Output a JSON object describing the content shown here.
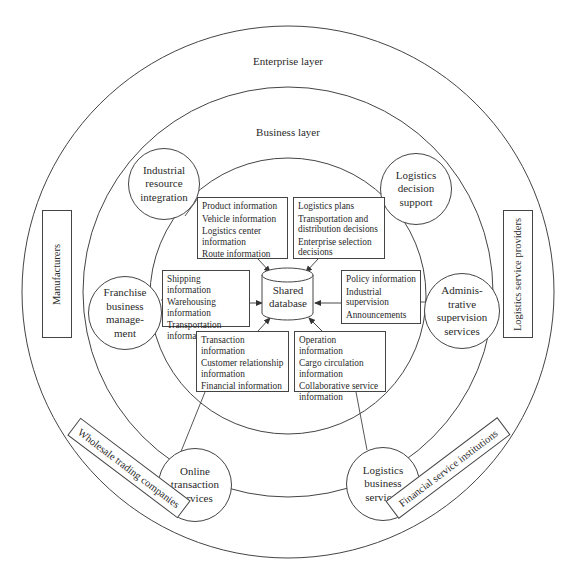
{
  "layers": {
    "enterprise": "Enterprise layer",
    "business": "Business layer"
  },
  "core": {
    "database_line1": "Shared",
    "database_line2": "database"
  },
  "service_nodes": [
    {
      "id": "industrial",
      "lines": [
        "Industrial",
        "resource",
        "integration"
      ]
    },
    {
      "id": "decision",
      "lines": [
        "Logistics",
        "decision",
        "support"
      ]
    },
    {
      "id": "franchise",
      "lines": [
        "Franchise",
        "business",
        "manage-",
        "ment"
      ]
    },
    {
      "id": "administrative",
      "lines": [
        "Adminis-",
        "trative",
        "supervision",
        "services"
      ]
    },
    {
      "id": "online",
      "lines": [
        "Online",
        "transaction",
        "services"
      ]
    },
    {
      "id": "logistics_business",
      "lines": [
        "Logistics",
        "business",
        "services"
      ]
    }
  ],
  "info_boxes": {
    "top_left": [
      "Product information",
      "Vehicle information",
      "Logistics center information",
      "Route information"
    ],
    "top_right": [
      "Logistics plans",
      "Transportation and distribution decisions",
      "Enterprise selection decisions"
    ],
    "left": [
      "Shipping information",
      "Warehousing information",
      "Transportation information"
    ],
    "right": [
      "Policy information",
      "Industrial supervision",
      "Announcements"
    ],
    "bottom_left": [
      "Transaction information",
      "Customer relationship information",
      "Financial information"
    ],
    "bottom_right": [
      "Operation information",
      "Cargo circulation information",
      "Collaborative service information"
    ]
  },
  "enterprises": {
    "left": "Manufacturers",
    "right": "Logistics service providers",
    "bottom_left": "Wholesale trading companies",
    "bottom_right": "Financial service institutions"
  },
  "colors": {
    "line": "#444444",
    "text": "#2a2a2a",
    "background": "#ffffff"
  }
}
